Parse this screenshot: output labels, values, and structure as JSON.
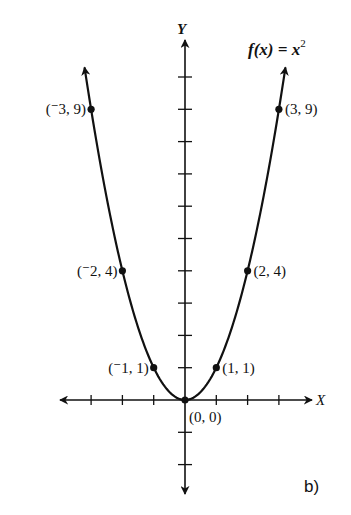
{
  "chart_data": {
    "type": "line",
    "title": "",
    "function_label": "f(x) = x",
    "function_exponent": "2",
    "xlabel": "X",
    "ylabel": "Y",
    "panel_label": "b)",
    "xlim": [
      -3.5,
      4
    ],
    "ylim": [
      -3,
      11
    ],
    "grid": false,
    "legend": "none",
    "x_ticks": [
      -3,
      -2,
      -1,
      1,
      2,
      3
    ],
    "y_ticks": [
      -2,
      -1,
      1,
      2,
      3,
      4,
      5,
      6,
      7,
      8,
      9,
      10
    ],
    "series": [
      {
        "name": "f(x) = x^2",
        "x": [
          -3,
          -2,
          -1,
          0,
          1,
          2,
          3
        ],
        "y": [
          9,
          4,
          1,
          0,
          1,
          4,
          9
        ]
      }
    ],
    "points": [
      {
        "x": -3,
        "y": 9,
        "label": "(⁻3, 9)"
      },
      {
        "x": -2,
        "y": 4,
        "label": "(⁻2, 4)"
      },
      {
        "x": -1,
        "y": 1,
        "label": "(⁻1, 1)"
      },
      {
        "x": 0,
        "y": 0,
        "label": "(0, 0)"
      },
      {
        "x": 1,
        "y": 1,
        "label": "(1, 1)"
      },
      {
        "x": 2,
        "y": 4,
        "label": "(2, 4)"
      },
      {
        "x": 3,
        "y": 9,
        "label": "(3, 9)"
      }
    ]
  }
}
